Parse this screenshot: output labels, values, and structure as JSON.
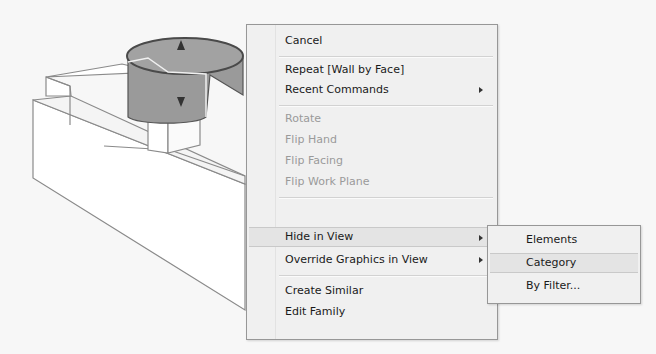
{
  "context_menu": {
    "items": [
      {
        "label": "Cancel",
        "enabled": true
      },
      {
        "label": "Repeat [Wall by Face]",
        "enabled": true
      },
      {
        "label": "Recent Commands",
        "enabled": true,
        "submenu": true
      },
      {
        "label": "Rotate",
        "enabled": false
      },
      {
        "label": "Flip Hand",
        "enabled": false
      },
      {
        "label": "Flip Facing",
        "enabled": false
      },
      {
        "label": "Flip Work Plane",
        "enabled": false
      },
      {
        "label": "Hide in View",
        "enabled": true,
        "submenu": true,
        "highlighted": true
      },
      {
        "label": "Override Graphics in View",
        "enabled": true,
        "submenu": true
      },
      {
        "label": "Create Similar",
        "enabled": true
      },
      {
        "label": "Edit Family",
        "enabled": true
      }
    ]
  },
  "submenu_hide_in_view": {
    "items": [
      {
        "label": "Elements"
      },
      {
        "label": "Category",
        "highlighted": true
      },
      {
        "label": "By Filter..."
      }
    ]
  },
  "model": {
    "element": "curved-wall-cylinder",
    "controls": [
      "flip-arrow-up-icon",
      "flip-arrow-down-icon"
    ],
    "colors": {
      "selection": "#8f8f8f",
      "lines": "#666666"
    }
  }
}
